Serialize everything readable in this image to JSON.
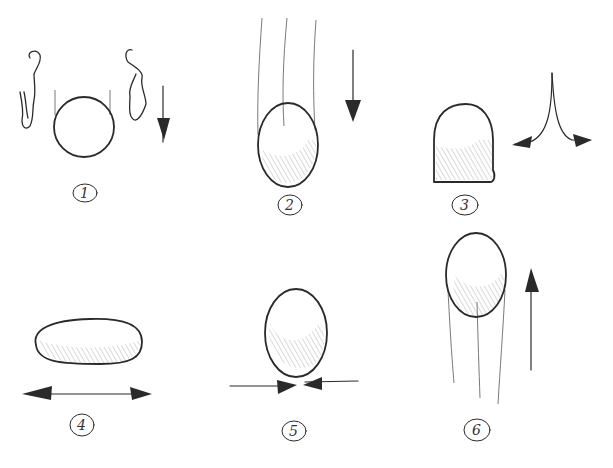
{
  "colors": {
    "ink": "#2a2a2a",
    "hatch": "#8a8a8a",
    "paper": "#ffffff"
  },
  "frames": [
    {
      "number": "1",
      "label": "1",
      "shape": "round ball",
      "motion": "falling",
      "arrow": "down",
      "extras": "motion smear marks on both sides"
    },
    {
      "number": "2",
      "label": "2",
      "shape": "stretched vertical ball",
      "motion": "falling fast",
      "arrow": "down",
      "extras": "speed lines above"
    },
    {
      "number": "3",
      "label": "3",
      "shape": "flattened base on contact",
      "motion": "impact",
      "arrow": "split outward",
      "extras": ""
    },
    {
      "number": "4",
      "label": "4",
      "shape": "fully squashed ball",
      "motion": "maximum squash",
      "arrow": "horizontal double-headed outward",
      "extras": ""
    },
    {
      "number": "5",
      "label": "5",
      "shape": "recovering ball",
      "motion": "rebound",
      "arrow": "horizontal inward",
      "extras": ""
    },
    {
      "number": "6",
      "label": "6",
      "shape": "stretched ball rising",
      "motion": "rising",
      "arrow": "up",
      "extras": "speed lines below"
    }
  ]
}
